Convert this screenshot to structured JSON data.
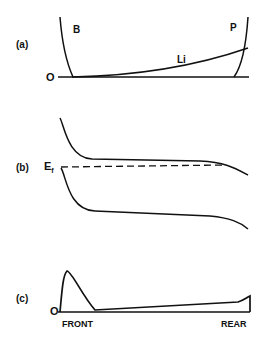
{
  "panels": {
    "a": {
      "label": "(a)",
      "origin_label": "O",
      "curve_labels": {
        "left": "B",
        "right": "P",
        "middle": "Li"
      }
    },
    "b": {
      "label": "(b)",
      "fermi_label": "E",
      "fermi_subscript": "f"
    },
    "c": {
      "label": "(c)",
      "origin_label": "O",
      "x_labels": {
        "left": "FRONT",
        "right": "REAR"
      }
    }
  },
  "colors": {
    "ink": "#111111",
    "background": "#ffffff"
  }
}
